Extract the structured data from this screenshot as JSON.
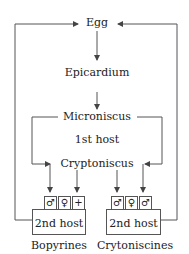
{
  "stages": {
    "egg": "Egg",
    "epicardium": "Epicardium",
    "microniscus": "Microniscus",
    "first_host": "1st host",
    "cryptoniscus": "Cryptoniscus"
  },
  "groups": [
    {
      "name": "Bopyrines",
      "host_label": "2nd host",
      "symbols": [
        "♂",
        "♀",
        "+"
      ]
    },
    {
      "name": "Crytoniscines",
      "host_label": "2nd host",
      "symbols": [
        "♂",
        "♀",
        "♂"
      ]
    }
  ],
  "colors": {
    "line": "#555555",
    "text": "#222222"
  }
}
